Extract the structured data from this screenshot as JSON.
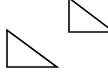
{
  "canvas": {
    "width": 108,
    "height": 72,
    "background_color": "#ffffff",
    "description": "Two outlined right triangles on a plain white background"
  },
  "style": {
    "stroke_color": "#000000",
    "fill_color": "none",
    "stroke_width": 1.6
  },
  "shapes": [
    {
      "name": "lower-left-triangle",
      "type": "right-triangle",
      "orientation": "right-angle-bottom-left",
      "points": "7,30 7,67 57,67",
      "vertices": {
        "apex_top": [
          7,
          30
        ],
        "right_angle": [
          7,
          67
        ],
        "bottom_right": [
          57,
          67
        ]
      },
      "clipped": false
    },
    {
      "name": "upper-right-triangle",
      "type": "right-triangle",
      "orientation": "right-angle-bottom-left",
      "points": "69,-2 69,32 114,32",
      "vertices": {
        "apex_top": [
          69,
          -2
        ],
        "right_angle": [
          69,
          32
        ],
        "bottom_right": [
          114,
          32
        ]
      },
      "clipped": true,
      "clipped_edges": [
        "top",
        "right"
      ]
    }
  ]
}
